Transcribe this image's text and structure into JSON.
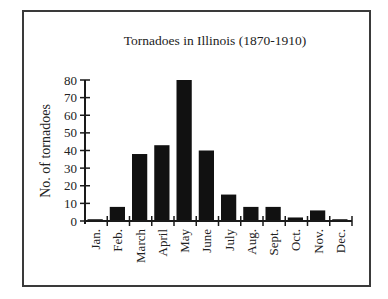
{
  "chart_data": {
    "type": "bar",
    "title": "Tornadoes in Illinois (1870-1910)",
    "xlabel": "",
    "ylabel": "No. of tornadoes",
    "categories": [
      "Jan.",
      "Feb.",
      "March",
      "April",
      "May",
      "June",
      "July",
      "Aug.",
      "Sept.",
      "Oct.",
      "Nov.",
      "Dec."
    ],
    "values": [
      1,
      8,
      38,
      43,
      80,
      40,
      15,
      8,
      8,
      2,
      6,
      1
    ],
    "ylim": [
      0,
      80
    ],
    "yticks": [
      0,
      10,
      20,
      30,
      40,
      50,
      60,
      70,
      80
    ],
    "grid": false,
    "legend": null,
    "bar_color": "#111111"
  }
}
